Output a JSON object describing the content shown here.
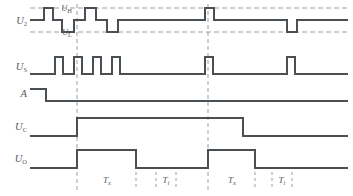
{
  "figure": {
    "type": "timing-diagram",
    "title": "",
    "background": "#ffffff",
    "trace_color": "#4a4f54",
    "dash_color": "#9aa0a6",
    "label_color": "#555a5e",
    "width": 353,
    "height": 196
  },
  "signals": [
    {
      "id": "u2",
      "base": "U",
      "sub": "2",
      "label": "U2"
    },
    {
      "id": "us",
      "base": "U",
      "sub": "S",
      "label": "US"
    },
    {
      "id": "a",
      "base": "A",
      "sub": "",
      "label": "A"
    },
    {
      "id": "uc",
      "base": "U",
      "sub": "C",
      "label": "UC"
    },
    {
      "id": "uo",
      "base": "U",
      "sub": "O",
      "label": "UO"
    }
  ],
  "thresholds": [
    {
      "id": "uh",
      "base": "U",
      "sub": "H",
      "label": "UH"
    },
    {
      "id": "ul",
      "base": "U",
      "sub": "L",
      "label": "UL"
    }
  ],
  "intervals": [
    {
      "base": "T",
      "sub": "x",
      "label": "Tx"
    },
    {
      "base": "T",
      "sub": "i",
      "label": "Ti"
    },
    {
      "base": "T",
      "sub": "x",
      "label": "Tx"
    },
    {
      "base": "T",
      "sub": "i",
      "label": "Ti"
    }
  ],
  "chart_data": {
    "type": "line",
    "xlabel": "time",
    "ylabel": "",
    "x_range": [
      30,
      348
    ],
    "guide_lines_x": [
      77,
      208
    ],
    "traces": {
      "u2": {
        "y_high": 8,
        "y_mid": 20,
        "y_low": 32,
        "points": [
          [
            30,
            20
          ],
          [
            44,
            20
          ],
          [
            44,
            8
          ],
          [
            53,
            8
          ],
          [
            53,
            20
          ],
          [
            62,
            20
          ],
          [
            62,
            32
          ],
          [
            74,
            32
          ],
          [
            74,
            20
          ],
          [
            85,
            20
          ],
          [
            85,
            8
          ],
          [
            96,
            8
          ],
          [
            96,
            20
          ],
          [
            107,
            20
          ],
          [
            107,
            32
          ],
          [
            118,
            32
          ],
          [
            118,
            20
          ],
          [
            205,
            20
          ],
          [
            205,
            8
          ],
          [
            214,
            8
          ],
          [
            214,
            20
          ],
          [
            287,
            20
          ],
          [
            287,
            32
          ],
          [
            297,
            32
          ],
          [
            297,
            20
          ],
          [
            348,
            20
          ]
        ]
      },
      "us": {
        "y_base": 74,
        "y_pulse": 57,
        "points": [
          [
            30,
            74
          ],
          [
            55,
            74
          ],
          [
            55,
            57
          ],
          [
            63,
            57
          ],
          [
            63,
            74
          ],
          [
            74,
            74
          ],
          [
            74,
            57
          ],
          [
            82,
            57
          ],
          [
            82,
            74
          ],
          [
            93,
            74
          ],
          [
            93,
            57
          ],
          [
            101,
            57
          ],
          [
            101,
            74
          ],
          [
            112,
            74
          ],
          [
            112,
            57
          ],
          [
            120,
            57
          ],
          [
            120,
            74
          ],
          [
            205,
            74
          ],
          [
            205,
            57
          ],
          [
            213,
            57
          ],
          [
            213,
            74
          ],
          [
            287,
            74
          ],
          [
            287,
            57
          ],
          [
            295,
            57
          ],
          [
            295,
            74
          ],
          [
            348,
            74
          ]
        ]
      },
      "a": {
        "y_high": 89,
        "y_low": 101,
        "points": [
          [
            30,
            89
          ],
          [
            46,
            89
          ],
          [
            46,
            101
          ],
          [
            348,
            101
          ]
        ]
      },
      "uc": {
        "y_low": 136,
        "y_high": 118,
        "points": [
          [
            30,
            136
          ],
          [
            77,
            136
          ],
          [
            77,
            118
          ],
          [
            243,
            118
          ],
          [
            243,
            136
          ],
          [
            348,
            136
          ]
        ]
      },
      "uo": {
        "y_low": 168,
        "y_high": 150,
        "points": [
          [
            30,
            168
          ],
          [
            77,
            168
          ],
          [
            77,
            150
          ],
          [
            136,
            150
          ],
          [
            136,
            168
          ],
          [
            208,
            168
          ],
          [
            208,
            150
          ],
          [
            255,
            150
          ],
          [
            255,
            168
          ],
          [
            348,
            168
          ]
        ]
      }
    },
    "interval_marks_x": [
      77,
      136,
      156,
      176,
      208,
      255,
      272,
      292
    ],
    "interval_labels": [
      {
        "text": "Tx",
        "x": 107,
        "y": 183
      },
      {
        "text": "Ti",
        "x": 166,
        "y": 183
      },
      {
        "text": "Tx",
        "x": 232,
        "y": 183
      },
      {
        "text": "Ti",
        "x": 282,
        "y": 183
      }
    ]
  }
}
